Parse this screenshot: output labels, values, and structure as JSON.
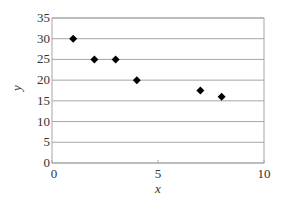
{
  "chart_data": {
    "type": "scatter",
    "title": "",
    "xlabel": "x",
    "ylabel": "y",
    "xlim": [
      0,
      10
    ],
    "ylim": [
      0,
      35
    ],
    "x_ticks": [
      0,
      5,
      10
    ],
    "y_ticks": [
      0,
      5,
      10,
      15,
      20,
      25,
      30,
      35
    ],
    "grid": "horizontal",
    "legend": "none",
    "marker": "diamond",
    "marker_color": "#000000",
    "gridline_color": "#a6a6a6",
    "series": [
      {
        "name": "data",
        "points": [
          {
            "x": 1,
            "y": 30
          },
          {
            "x": 2,
            "y": 25
          },
          {
            "x": 3,
            "y": 25
          },
          {
            "x": 4,
            "y": 20
          },
          {
            "x": 7,
            "y": 17.5
          },
          {
            "x": 8,
            "y": 16
          }
        ]
      }
    ]
  }
}
